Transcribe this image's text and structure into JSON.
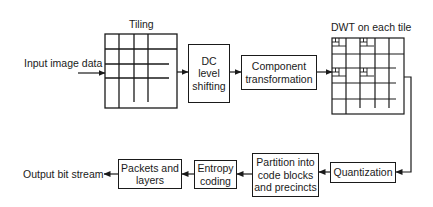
{
  "diagram": {
    "type": "flowchart",
    "top_row": {
      "input_label": "Input image data",
      "tiling_label": "Tiling",
      "dc_level_shifting": [
        "DC",
        "level",
        "shifting"
      ],
      "component_transformation": [
        "Component",
        "transformation"
      ],
      "dwt_label": "DWT on each tile"
    },
    "bottom_row": {
      "quantization": "Quantization",
      "partition": [
        "Partition into",
        "code blocks",
        "and precincts"
      ],
      "entropy_coding": [
        "Entropy",
        "coding"
      ],
      "packets_and_layers": [
        "Packets and",
        "layers"
      ],
      "output_label": "Output bit stream"
    },
    "flow": [
      "Input image data",
      "Tiling",
      "DC level shifting",
      "Component transformation",
      "DWT on each tile",
      "Quantization",
      "Partition into code blocks and precincts",
      "Entropy coding",
      "Packets and layers",
      "Output bit stream"
    ],
    "colors": {
      "stroke": "#1a1a1a",
      "background": "#ffffff"
    }
  }
}
